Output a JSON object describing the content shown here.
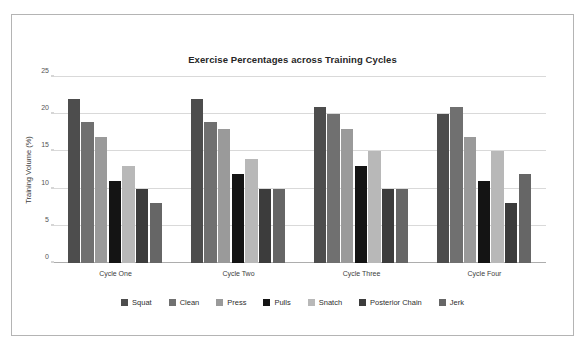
{
  "chart_data": {
    "type": "bar",
    "title": "Exercise Percentages across Training Cycles",
    "xlabel": "",
    "ylabel": "Training Volume (%)",
    "categories": [
      "Cycle One",
      "Cycle Two",
      "Cycle Three",
      "Cycle Four"
    ],
    "ylim": [
      0,
      25
    ],
    "yticks": [
      0,
      5,
      10,
      15,
      20,
      25
    ],
    "grid": true,
    "legend_position": "bottom",
    "series": [
      {
        "name": "Squat",
        "color": "#4d4d4d",
        "values": [
          22,
          22,
          21,
          20
        ]
      },
      {
        "name": "Clean",
        "color": "#707070",
        "values": [
          19,
          19,
          20,
          21
        ]
      },
      {
        "name": "Press",
        "color": "#9a9a9a",
        "values": [
          17,
          18,
          18,
          17
        ]
      },
      {
        "name": "Pulls",
        "color": "#141414",
        "values": [
          11,
          12,
          13,
          11
        ]
      },
      {
        "name": "Snatch",
        "color": "#b8b8b8",
        "values": [
          13,
          14,
          15,
          15
        ]
      },
      {
        "name": "Posterior Chain",
        "color": "#3c3c3c",
        "values": [
          10,
          10,
          10,
          8
        ]
      },
      {
        "name": "Jerk",
        "color": "#666666",
        "values": [
          8,
          10,
          10,
          12
        ]
      }
    ]
  }
}
